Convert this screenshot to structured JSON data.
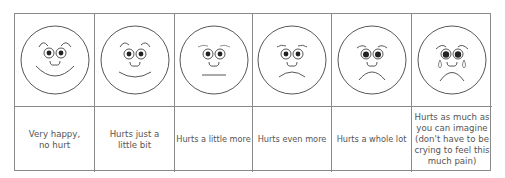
{
  "pain_scale": {
    "faces": [
      {
        "face": "very-happy-face",
        "label": "Very happy, no hurt"
      },
      {
        "face": "smiling-face",
        "label": "Hurts just a little bit"
      },
      {
        "face": "neutral-face",
        "label": "Hurts a little more"
      },
      {
        "face": "slight-frown-face",
        "label": "Hurts even more"
      },
      {
        "face": "frowning-face",
        "label": "Hurts a whole lot"
      },
      {
        "face": "crying-face",
        "label": "Hurts as much as you can imagine (don't have to be crying to feel this much pain)"
      }
    ]
  },
  "colors": {
    "line": "#8a8a8a",
    "stroke": "#333333",
    "text": "#555555"
  }
}
